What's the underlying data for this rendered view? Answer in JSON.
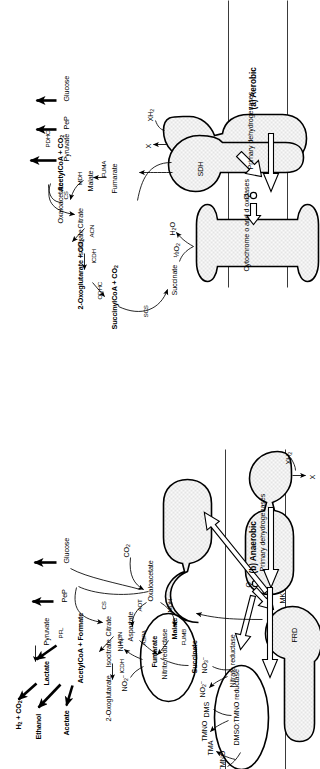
{
  "figure": {
    "type": "biochemical-pathway-diagram",
    "orientation": "page-rotated-90-ccw"
  },
  "panels": [
    {
      "id": "anaerobic",
      "title": "(b) Anaerobic",
      "metabolites": [
        {
          "id": "glucose",
          "label": "Glucose"
        },
        {
          "id": "pep",
          "label": "PeP"
        },
        {
          "id": "pyruvate",
          "label": "Pyruvate"
        },
        {
          "id": "lactate",
          "label": "Lactate"
        },
        {
          "id": "acetylcoa_formate",
          "label": "AcetylCoA + Formate"
        },
        {
          "id": "h2_co2",
          "label": "H2 + CO2"
        },
        {
          "id": "ethanol",
          "label": "Ethanol"
        },
        {
          "id": "acetate",
          "label": "Acetate"
        },
        {
          "id": "co2",
          "label": "CO2"
        },
        {
          "id": "citrate",
          "label": "Citrate"
        },
        {
          "id": "isocitrate",
          "label": "Isocitrate"
        },
        {
          "id": "oxoglutarate",
          "label": "2-Oxoglutarate"
        },
        {
          "id": "oxaloacetate",
          "label": "Oxaloacetate"
        },
        {
          "id": "aspartate",
          "label": "Aspartate"
        },
        {
          "id": "malate",
          "label": "Malate"
        },
        {
          "id": "fumarate",
          "label": "Fumarate"
        },
        {
          "id": "succinate",
          "label": "Succinate"
        }
      ],
      "enzymes": [
        {
          "id": "pfl",
          "label": "PFL"
        },
        {
          "id": "cs",
          "label": "CS"
        },
        {
          "id": "acn",
          "label": "ACN"
        },
        {
          "id": "icdh",
          "label": "ICDH"
        },
        {
          "id": "aot",
          "label": "AOT"
        },
        {
          "id": "aspa",
          "label": "ASPA"
        },
        {
          "id": "mdh",
          "label": "MDH"
        },
        {
          "id": "fumb",
          "label": "FUMB"
        }
      ],
      "membrane_complexes": [
        {
          "id": "primary-dehydrogenases",
          "label": "Primary dehydrogenases"
        },
        {
          "id": "frd",
          "label": "FRD"
        },
        {
          "id": "nitrate-reductase",
          "label": "Nitrate reductase"
        },
        {
          "id": "nitrite-reductase",
          "label": "Nitrite reductase"
        },
        {
          "id": "dmso-tmno-reductase",
          "label": "DMSO:TMNO reductase"
        }
      ],
      "carriers": [
        {
          "id": "mk",
          "label": "MK"
        },
        {
          "id": "q",
          "label": "Q"
        }
      ],
      "substrates": [
        {
          "id": "xh2",
          "label": "XH2"
        },
        {
          "id": "x",
          "label": "X"
        },
        {
          "id": "nitrate",
          "label": "NO3-"
        },
        {
          "id": "nitrite_out",
          "label": "NO2-"
        },
        {
          "id": "nitrite_in",
          "label": "NO2-"
        },
        {
          "id": "ammonium",
          "label": "NH4+"
        },
        {
          "id": "dmso",
          "label": "DMSO"
        },
        {
          "id": "dms",
          "label": "DMS"
        },
        {
          "id": "tmno",
          "label": "TMNO"
        },
        {
          "id": "tma",
          "label": "TMA"
        }
      ]
    },
    {
      "id": "aerobic",
      "title": "(a) Aerobic",
      "metabolites": [
        {
          "id": "glucose",
          "label": "Glucose"
        },
        {
          "id": "pep",
          "label": "PeP"
        },
        {
          "id": "pyruvate",
          "label": "Pyruvate"
        },
        {
          "id": "acetylcoa_co2",
          "label": "AcetylCoA + CO2"
        },
        {
          "id": "citrate",
          "label": "Citrate"
        },
        {
          "id": "isocitrate",
          "label": "Isocitrate"
        },
        {
          "id": "oxoglutarate_co2",
          "label": "2-Oxoglutarate + CO2"
        },
        {
          "id": "succinylcoa_co2",
          "label": "SuccinylCoA + CO2"
        },
        {
          "id": "succinate",
          "label": "Succinate"
        },
        {
          "id": "fumarate",
          "label": "Fumarate"
        },
        {
          "id": "malate",
          "label": "Malate"
        },
        {
          "id": "oxaloacetate",
          "label": "Oxaloacetate"
        }
      ],
      "enzymes": [
        {
          "id": "pdhc",
          "label": "PDHC"
        },
        {
          "id": "cs",
          "label": "CS"
        },
        {
          "id": "acn",
          "label": "ACN"
        },
        {
          "id": "icdh",
          "label": "ICDH"
        },
        {
          "id": "odhc",
          "label": "ODHC"
        },
        {
          "id": "scs",
          "label": "SCS"
        },
        {
          "id": "fuma",
          "label": "FUMA"
        },
        {
          "id": "mdh",
          "label": "MDH"
        }
      ],
      "membrane_complexes": [
        {
          "id": "primary-dehydrogenases",
          "label": "Primary dehydrogenases"
        },
        {
          "id": "sdh",
          "label": "SDH"
        },
        {
          "id": "cytochrome-oxidases",
          "label": "Cytochrome o and d oxidases"
        }
      ],
      "carriers": [
        {
          "id": "q",
          "label": "Q"
        }
      ],
      "substrates": [
        {
          "id": "xh2",
          "label": "XH2"
        },
        {
          "id": "x",
          "label": "X"
        },
        {
          "id": "oxygen",
          "label": "1/2O2"
        },
        {
          "id": "water",
          "label": "H2O"
        }
      ]
    }
  ],
  "colors": {
    "ink": "#000000",
    "membrane_line": "#3a3a3a",
    "stipple": "#d8d8d8",
    "background": "#ffffff"
  }
}
